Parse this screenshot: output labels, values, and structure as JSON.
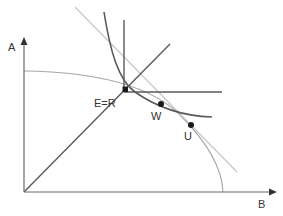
{
  "diagram": {
    "type": "economics-diagram",
    "axes": {
      "y_label": "A",
      "x_label": "B"
    },
    "points": [
      {
        "id": "E=R",
        "label": "E=R",
        "marker": "square"
      },
      {
        "id": "W",
        "label": "W",
        "marker": "circle"
      },
      {
        "id": "U",
        "label": "U",
        "marker": "circle"
      }
    ],
    "elements": [
      "production possibility frontier (light curved arc from A-axis to B-axis)",
      "45-degree ray from origin",
      "vertical line through E=R",
      "horizontal line through E=R",
      "indifference curve (dark convex curve through W)",
      "price/tangent line (light straight line through U)"
    ],
    "colors": {
      "axis": "#6b6b6b",
      "dark_line": "#5a5a5a",
      "light_line": "#c4c4c4",
      "frontier": "#a8a8a8",
      "point": "#1a1a1a"
    }
  }
}
